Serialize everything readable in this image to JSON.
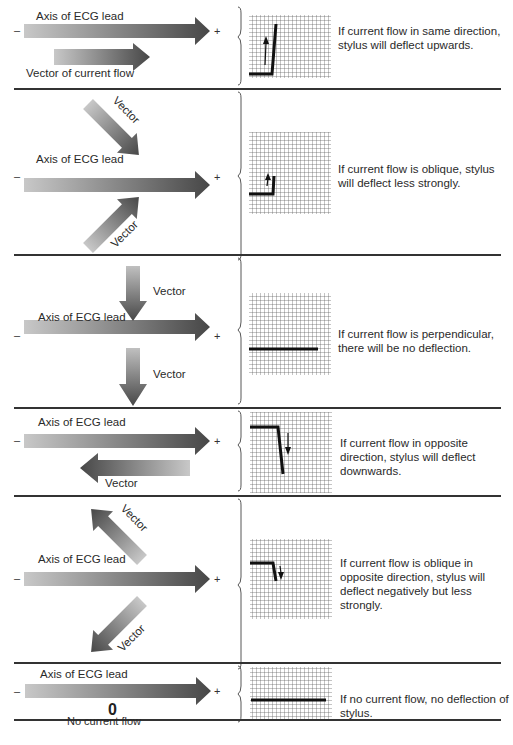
{
  "figure": {
    "axis_label": "Axis of ECG lead",
    "minus_sign": "–",
    "plus_sign": "+",
    "panels": [
      {
        "id": "same-direction",
        "vector_label": "Vector of current flow",
        "description": "If current flow in same direction, stylus will deflect upwards.",
        "deflection": "upward-strong"
      },
      {
        "id": "oblique",
        "vector_label_top": "Vector",
        "vector_label_bottom": "Vector",
        "description": "If current flow is oblique, stylus will deflect less strongly.",
        "deflection": "upward-weak"
      },
      {
        "id": "perpendicular",
        "vector_label_top": "Vector",
        "vector_label_bottom": "Vector",
        "description": "If current flow is perpendicular, there will be no deflection.",
        "deflection": "none"
      },
      {
        "id": "opposite-direction",
        "vector_label": "Vector",
        "description": "If current flow in opposite direction, stylus will deflect downwards.",
        "deflection": "downward-strong"
      },
      {
        "id": "oblique-opposite",
        "vector_label_top": "Vector",
        "vector_label_bottom": "Vector",
        "description": "If current flow is oblique in opposite direction, stylus will deflect negatively but less strongly.",
        "deflection": "downward-weak"
      },
      {
        "id": "no-current",
        "zero_label": "0",
        "vector_label": "No current flow",
        "description": "If no current flow, no deflection of stylus.",
        "deflection": "none"
      }
    ]
  },
  "colors": {
    "arrow_light": "#c4c4c4",
    "arrow_dark": "#4a4a4a",
    "grid": "#555555",
    "trace": "#111111",
    "divider": "#333333"
  }
}
